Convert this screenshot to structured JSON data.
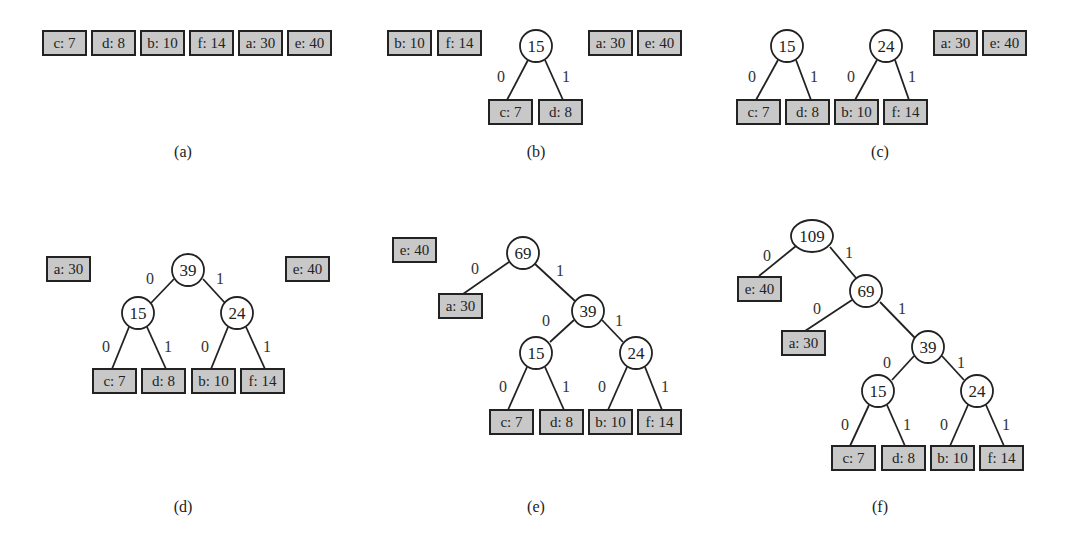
{
  "symbols": [
    {
      "char": "c",
      "freq": 7
    },
    {
      "char": "d",
      "freq": 8
    },
    {
      "char": "b",
      "freq": 10
    },
    {
      "char": "f",
      "freq": 14
    },
    {
      "char": "a",
      "freq": 30
    },
    {
      "char": "e",
      "freq": 40
    }
  ],
  "edge_labels": {
    "left": "0",
    "right": "1"
  },
  "panels": [
    {
      "caption": "(a)",
      "cx": 183,
      "cy": 157,
      "leaves": [
        {
          "label": "c: 7",
          "x": 43,
          "y": 31
        },
        {
          "label": "d: 8",
          "x": 92,
          "y": 31
        },
        {
          "label": "b: 10",
          "x": 141,
          "y": 31
        },
        {
          "label": "f: 14",
          "x": 190,
          "y": 31
        },
        {
          "label": "a: 30",
          "x": 239,
          "y": 31
        },
        {
          "label": "e: 40",
          "x": 288,
          "y": 31
        }
      ],
      "nodes": [],
      "edges": []
    },
    {
      "caption": "(b)",
      "cx": 536,
      "cy": 157,
      "leaves": [
        {
          "label": "b: 10",
          "x": 388,
          "y": 31,
          "id": "b"
        },
        {
          "label": "f: 14",
          "x": 438,
          "y": 31,
          "id": "f"
        },
        {
          "label": "c: 7",
          "x": 489,
          "y": 100,
          "id": "c"
        },
        {
          "label": "d: 8",
          "x": 539,
          "y": 100,
          "id": "d"
        },
        {
          "label": "a: 30",
          "x": 589,
          "y": 31,
          "id": "a"
        },
        {
          "label": "e: 40",
          "x": 638,
          "y": 31,
          "id": "e"
        }
      ],
      "nodes": [
        {
          "label": "15",
          "x": 536,
          "y": 46,
          "r": 16
        }
      ],
      "edges": [
        {
          "x1": 528,
          "y1": 60,
          "x2": 507,
          "y2": 100,
          "label": "0",
          "lx": 501,
          "ly": 82
        },
        {
          "x1": 545,
          "y1": 60,
          "x2": 563,
          "y2": 100,
          "label": "1",
          "lx": 566,
          "ly": 82
        }
      ]
    },
    {
      "caption": "(c)",
      "cx": 880,
      "cy": 157,
      "leaves": [
        {
          "label": "c: 7",
          "x": 737,
          "y": 100
        },
        {
          "label": "d: 8",
          "x": 786,
          "y": 100
        },
        {
          "label": "b: 10",
          "x": 835,
          "y": 100
        },
        {
          "label": "f: 14",
          "x": 884,
          "y": 100
        },
        {
          "label": "a: 30",
          "x": 934,
          "y": 31
        },
        {
          "label": "e: 40",
          "x": 983,
          "y": 31
        }
      ],
      "nodes": [
        {
          "label": "15",
          "x": 787,
          "y": 46,
          "r": 16
        },
        {
          "label": "24",
          "x": 886,
          "y": 46,
          "r": 16
        }
      ],
      "edges": [
        {
          "x1": 778,
          "y1": 60,
          "x2": 756,
          "y2": 100,
          "label": "0",
          "lx": 752,
          "ly": 82
        },
        {
          "x1": 796,
          "y1": 60,
          "x2": 811,
          "y2": 100,
          "label": "1",
          "lx": 814,
          "ly": 82
        },
        {
          "x1": 877,
          "y1": 60,
          "x2": 855,
          "y2": 100,
          "label": "0",
          "lx": 851,
          "ly": 82
        },
        {
          "x1": 895,
          "y1": 60,
          "x2": 909,
          "y2": 100,
          "label": "1",
          "lx": 912,
          "ly": 82
        }
      ]
    },
    {
      "caption": "(d)",
      "cx": 183,
      "cy": 512,
      "leaves": [
        {
          "label": "a: 30",
          "x": 47,
          "y": 257
        },
        {
          "label": "e: 40",
          "x": 286,
          "y": 257
        },
        {
          "label": "c: 7",
          "x": 93,
          "y": 369
        },
        {
          "label": "d: 8",
          "x": 142,
          "y": 369
        },
        {
          "label": "b: 10",
          "x": 192,
          "y": 369
        },
        {
          "label": "f: 14",
          "x": 241,
          "y": 369
        }
      ],
      "nodes": [
        {
          "label": "39",
          "x": 188,
          "y": 270,
          "r": 16
        },
        {
          "label": "15",
          "x": 138,
          "y": 313,
          "r": 16
        },
        {
          "label": "24",
          "x": 237,
          "y": 313,
          "r": 16
        }
      ],
      "edges": [
        {
          "x1": 174,
          "y1": 279,
          "x2": 151,
          "y2": 303,
          "label": "0",
          "lx": 150,
          "ly": 284
        },
        {
          "x1": 203,
          "y1": 279,
          "x2": 225,
          "y2": 303,
          "label": "1",
          "lx": 220,
          "ly": 284
        },
        {
          "x1": 129,
          "y1": 327,
          "x2": 112,
          "y2": 369,
          "label": "0",
          "lx": 106,
          "ly": 352
        },
        {
          "x1": 147,
          "y1": 327,
          "x2": 166,
          "y2": 369,
          "label": "1",
          "lx": 168,
          "ly": 352
        },
        {
          "x1": 228,
          "y1": 327,
          "x2": 211,
          "y2": 369,
          "label": "0",
          "lx": 205,
          "ly": 352
        },
        {
          "x1": 246,
          "y1": 327,
          "x2": 265,
          "y2": 369,
          "label": "1",
          "lx": 267,
          "ly": 352
        }
      ]
    },
    {
      "caption": "(e)",
      "cx": 536,
      "cy": 512,
      "leaves": [
        {
          "label": "e: 40",
          "x": 393,
          "y": 238
        },
        {
          "label": "a: 30",
          "x": 439,
          "y": 294
        },
        {
          "label": "c: 7",
          "x": 490,
          "y": 410
        },
        {
          "label": "d: 8",
          "x": 540,
          "y": 410
        },
        {
          "label": "b: 10",
          "x": 589,
          "y": 410
        },
        {
          "label": "f: 14",
          "x": 638,
          "y": 410
        }
      ],
      "nodes": [
        {
          "label": "69",
          "x": 523,
          "y": 253,
          "r": 16
        },
        {
          "label": "39",
          "x": 588,
          "y": 311,
          "r": 16
        },
        {
          "label": "15",
          "x": 536,
          "y": 353,
          "r": 16
        },
        {
          "label": "24",
          "x": 636,
          "y": 353,
          "r": 16
        }
      ],
      "edges": [
        {
          "x1": 509,
          "y1": 262,
          "x2": 463,
          "y2": 294,
          "label": "0",
          "lx": 475,
          "ly": 274
        },
        {
          "x1": 535,
          "y1": 264,
          "x2": 575,
          "y2": 301,
          "label": "1",
          "lx": 560,
          "ly": 276
        },
        {
          "x1": 574,
          "y1": 320,
          "x2": 550,
          "y2": 342,
          "label": "0",
          "lx": 546,
          "ly": 326
        },
        {
          "x1": 602,
          "y1": 320,
          "x2": 623,
          "y2": 342,
          "label": "1",
          "lx": 619,
          "ly": 326
        },
        {
          "x1": 527,
          "y1": 367,
          "x2": 508,
          "y2": 410,
          "label": "0",
          "lx": 503,
          "ly": 392
        },
        {
          "x1": 545,
          "y1": 367,
          "x2": 564,
          "y2": 410,
          "label": "1",
          "lx": 566,
          "ly": 392
        },
        {
          "x1": 627,
          "y1": 367,
          "x2": 608,
          "y2": 410,
          "label": "0",
          "lx": 602,
          "ly": 392
        },
        {
          "x1": 645,
          "y1": 367,
          "x2": 662,
          "y2": 410,
          "label": "1",
          "lx": 665,
          "ly": 392
        }
      ]
    },
    {
      "caption": "(f)",
      "cx": 880,
      "cy": 512,
      "leaves": [
        {
          "label": "e: 40",
          "x": 738,
          "y": 277
        },
        {
          "label": "a: 30",
          "x": 782,
          "y": 331
        },
        {
          "label": "c: 7",
          "x": 832,
          "y": 446
        },
        {
          "label": "d: 8",
          "x": 882,
          "y": 446
        },
        {
          "label": "b: 10",
          "x": 931,
          "y": 446
        },
        {
          "label": "f: 14",
          "x": 980,
          "y": 446
        }
      ],
      "nodes": [
        {
          "label": "109",
          "x": 812,
          "y": 236,
          "rx": 21,
          "ry": 16
        },
        {
          "label": "69",
          "x": 866,
          "y": 291,
          "r": 16
        },
        {
          "label": "39",
          "x": 928,
          "y": 347,
          "r": 16
        },
        {
          "label": "15",
          "x": 878,
          "y": 391,
          "r": 16
        },
        {
          "label": "24",
          "x": 977,
          "y": 391,
          "r": 16
        }
      ],
      "edges": [
        {
          "x1": 796,
          "y1": 246,
          "x2": 759,
          "y2": 276,
          "label": "0",
          "lx": 767,
          "ly": 261
        },
        {
          "x1": 830,
          "y1": 247,
          "x2": 856,
          "y2": 278,
          "label": "1",
          "lx": 849,
          "ly": 258
        },
        {
          "x1": 852,
          "y1": 300,
          "x2": 805,
          "y2": 331,
          "label": "0",
          "lx": 817,
          "ly": 314
        },
        {
          "x1": 880,
          "y1": 302,
          "x2": 915,
          "y2": 338,
          "label": "1",
          "lx": 902,
          "ly": 314
        },
        {
          "x1": 914,
          "y1": 356,
          "x2": 892,
          "y2": 380,
          "label": "0",
          "lx": 887,
          "ly": 368
        },
        {
          "x1": 942,
          "y1": 356,
          "x2": 964,
          "y2": 380,
          "label": "1",
          "lx": 961,
          "ly": 368
        },
        {
          "x1": 869,
          "y1": 405,
          "x2": 850,
          "y2": 446,
          "label": "0",
          "lx": 845,
          "ly": 430
        },
        {
          "x1": 887,
          "y1": 405,
          "x2": 905,
          "y2": 446,
          "label": "1",
          "lx": 907,
          "ly": 430
        },
        {
          "x1": 968,
          "y1": 405,
          "x2": 950,
          "y2": 446,
          "label": "0",
          "lx": 944,
          "ly": 430
        },
        {
          "x1": 986,
          "y1": 405,
          "x2": 1004,
          "y2": 446,
          "label": "1",
          "lx": 1006,
          "ly": 430
        }
      ]
    }
  ],
  "style": {
    "leaf_fill": "#c8c8c8",
    "stroke": "#222222",
    "node_fill": "#ffffff"
  }
}
